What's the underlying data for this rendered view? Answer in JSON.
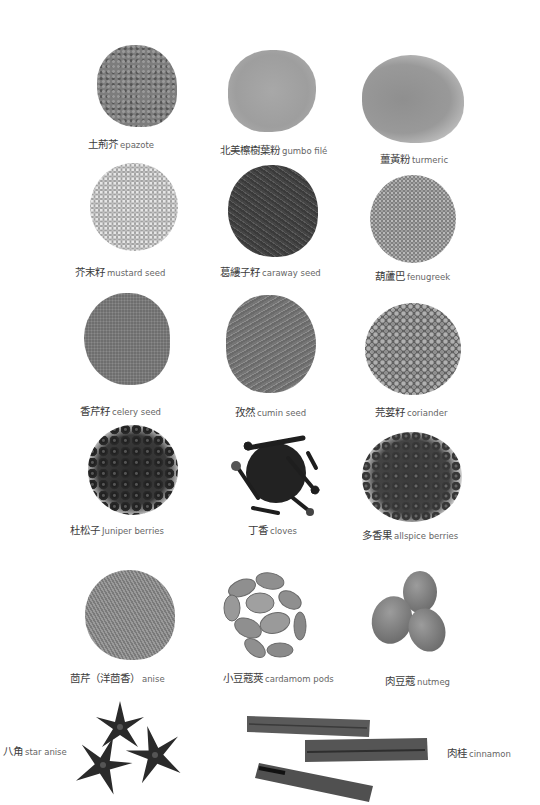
{
  "page": {
    "background": "#ffffff"
  },
  "spices": [
    {
      "zh": "土荊芥",
      "en": "epazote",
      "color": "#7d7d7d",
      "texture": "flakes"
    },
    {
      "zh": "北美檫樹葉粉",
      "en": "gumbo filé",
      "color": "#a3a3a3",
      "texture": "powder"
    },
    {
      "zh": "薑黃粉",
      "en": "turmeric",
      "color": "#9c9c9c",
      "texture": "powder"
    },
    {
      "zh": "芥末籽",
      "en": "mustard seed",
      "color": "#c4c4c4",
      "texture": "round-seeds"
    },
    {
      "zh": "葛縷子籽",
      "en": "caraway seed",
      "color": "#4a4a4a",
      "texture": "long-seeds"
    },
    {
      "zh": "葫蘆巴",
      "en": "fenugreek",
      "color": "#9a9a9a",
      "texture": "small-seeds"
    },
    {
      "zh": "香芹籽",
      "en": "celery seed",
      "color": "#6e6e6e",
      "texture": "fine-seeds"
    },
    {
      "zh": "孜然",
      "en": "cumin seed",
      "color": "#7a7a7a",
      "texture": "long-seeds"
    },
    {
      "zh": "芫荽籽",
      "en": "coriander",
      "color": "#8e8e8e",
      "texture": "round-seeds"
    },
    {
      "zh": "杜松子",
      "en": "Juniper berries",
      "color": "#2b2b2b",
      "texture": "berries"
    },
    {
      "zh": "丁香",
      "en": "cloves",
      "color": "#1e1e1e",
      "texture": "cloves"
    },
    {
      "zh": "多香果",
      "en": "allspice berries",
      "color": "#3a3a3a",
      "texture": "berries"
    },
    {
      "zh": "茴芹（洋茴香）",
      "en": "anise",
      "color": "#8a8a8a",
      "texture": "small-seeds"
    },
    {
      "zh": "小豆蔻莢",
      "en": "cardamom pods",
      "color": "#8f8f8f",
      "texture": "pods"
    },
    {
      "zh": "肉豆蔻",
      "en": "nutmeg",
      "color": "#8b8b8b",
      "texture": "nuts"
    },
    {
      "zh": "八角",
      "en": "star anise",
      "color": "#2a2a2a",
      "texture": "stars"
    },
    {
      "zh": "肉桂",
      "en": "cinnamon",
      "color": "#555555",
      "texture": "sticks"
    }
  ]
}
